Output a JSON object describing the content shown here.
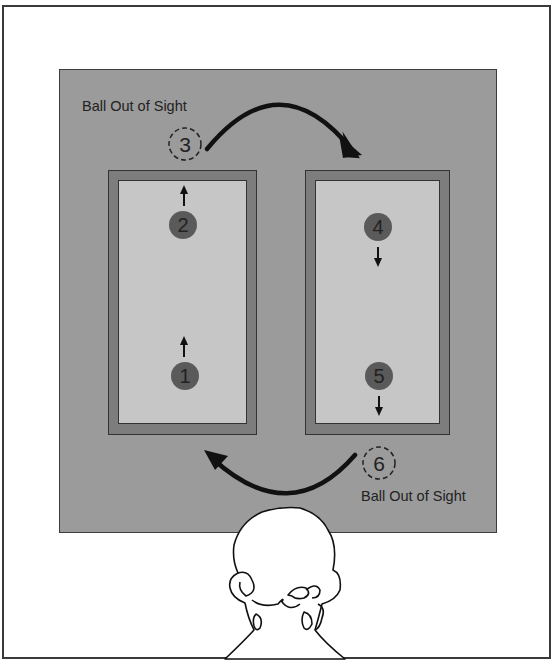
{
  "diagram": {
    "labels": {
      "top": "Ball Out of Sight",
      "bottom": "Ball Out of Sight"
    },
    "balls": [
      {
        "number": "1",
        "state": "visible",
        "window": "left",
        "direction": "up"
      },
      {
        "number": "2",
        "state": "visible",
        "window": "left",
        "direction": "up"
      },
      {
        "number": "3",
        "state": "out-of-sight",
        "window": "none",
        "direction": "arc-right"
      },
      {
        "number": "4",
        "state": "visible",
        "window": "right",
        "direction": "down"
      },
      {
        "number": "5",
        "state": "visible",
        "window": "right",
        "direction": "down"
      },
      {
        "number": "6",
        "state": "out-of-sight",
        "window": "none",
        "direction": "arc-left"
      }
    ],
    "colors": {
      "panel": "#9b9b9b",
      "window_frame": "#7d7d7d",
      "window_inner": "#c6c6c6",
      "ball": "#5a5a5a",
      "arrow": "#111111"
    },
    "observer": "head-back-view"
  }
}
